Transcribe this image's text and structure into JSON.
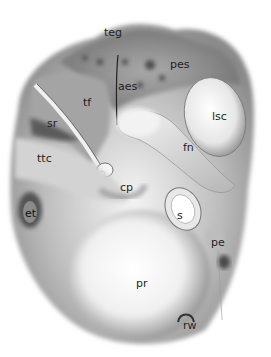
{
  "illustration": {
    "subject": "medial wall of tympanic cavity",
    "labels": [
      {
        "id": "teg",
        "text": "teg",
        "x": 105,
        "y": 29
      },
      {
        "id": "pes",
        "text": "pes",
        "x": 170,
        "y": 58
      },
      {
        "id": "aes",
        "text": "aes",
        "x": 118,
        "y": 82
      },
      {
        "id": "tf",
        "text": "tf",
        "x": 83,
        "y": 98
      },
      {
        "id": "lsc",
        "text": "lsc",
        "x": 212,
        "y": 111
      },
      {
        "id": "sr",
        "text": "sr",
        "x": 47,
        "y": 116
      },
      {
        "id": "fn",
        "text": "fn",
        "x": 183,
        "y": 141
      },
      {
        "id": "ttc",
        "text": "ttc",
        "x": 37,
        "y": 153
      },
      {
        "id": "cp",
        "text": "cp",
        "x": 120,
        "y": 181
      },
      {
        "id": "et",
        "text": "et",
        "x": 27,
        "y": 207
      },
      {
        "id": "s",
        "text": "s",
        "x": 177,
        "y": 209
      },
      {
        "id": "pe",
        "text": "pe",
        "x": 211,
        "y": 237
      },
      {
        "id": "pr",
        "text": "pr",
        "x": 136,
        "y": 276
      },
      {
        "id": "rw",
        "text": "rw",
        "x": 183,
        "y": 321
      }
    ],
    "colors": {
      "background": "#ffffff",
      "shade_dark": "#3a3a3a",
      "shade_mid": "#8a8a8a",
      "shade_light": "#d8d8d8",
      "highlight": "#fafafa"
    }
  }
}
